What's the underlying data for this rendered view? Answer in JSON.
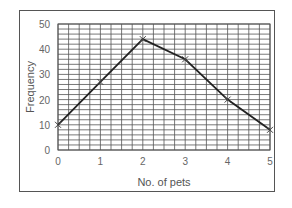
{
  "chart_data": {
    "type": "line",
    "title": "",
    "xlabel": "No. of pets",
    "ylabel": "Frequency",
    "x": [
      0,
      1,
      2,
      3,
      4,
      5
    ],
    "values": [
      10,
      27,
      44,
      36,
      20,
      8
    ],
    "series": [
      {
        "name": "Frequency",
        "x": [
          0,
          1,
          2,
          3,
          4,
          5
        ],
        "values": [
          10,
          27,
          44,
          36,
          20,
          8
        ],
        "marker": "x",
        "color": "#222222"
      }
    ],
    "xlim": [
      0,
      5
    ],
    "ylim": [
      0,
      50
    ],
    "x_ticks": [
      "0",
      "1",
      "2",
      "3",
      "4",
      "5"
    ],
    "y_ticks": [
      "0",
      "10",
      "20",
      "30",
      "40",
      "50"
    ],
    "grid": true,
    "grid_minor_y_step": 2,
    "grid_minor_x_step": 0.25,
    "legend": false
  },
  "colors": {
    "line": "#222222",
    "grid": "#555555",
    "frame": "#555555",
    "text": "#666666"
  }
}
